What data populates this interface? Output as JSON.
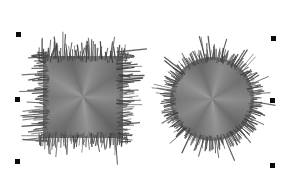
{
  "canvas": {
    "width": 289,
    "height": 174,
    "background": "#ffffff"
  },
  "objects": [
    {
      "name": "fringed-square",
      "shape": "rect",
      "x": 43,
      "y": 56,
      "width": 80,
      "height": 82,
      "fuzz": {
        "spacing": 1.25,
        "inset_min": 2,
        "inset_max": 7,
        "len_base": 3,
        "len_rand": 9,
        "long_chance": 0.18,
        "long_extra": 12,
        "tilt": 3.2,
        "seed": 11
      }
    },
    {
      "name": "fringed-circle",
      "shape": "circle",
      "cx": 212,
      "cy": 99,
      "r": 42,
      "fuzz": {
        "step_deg": 1.5,
        "inset_min": 2,
        "inset_max": 6,
        "len_base": 3,
        "len_rand": 8,
        "long_chance": 0.2,
        "long_extra": 11,
        "tilt_deg": 3,
        "seed": 29
      }
    }
  ],
  "fill_gradient": {
    "from_deg": -90,
    "stops": [
      {
        "color": "#7a7a7a",
        "angle": 0
      },
      {
        "color": "#929292",
        "angle": 32
      },
      {
        "color": "#6a6a6a",
        "angle": 72
      },
      {
        "color": "#8f8f8f",
        "angle": 106
      },
      {
        "color": "#707070",
        "angle": 146
      },
      {
        "color": "#8c8c8c",
        "angle": 182
      },
      {
        "color": "#676767",
        "angle": 226
      },
      {
        "color": "#959595",
        "angle": 262
      },
      {
        "color": "#6e6e6e",
        "angle": 300
      },
      {
        "color": "#898989",
        "angle": 332
      },
      {
        "color": "#7a7a7a",
        "angle": 360
      }
    ],
    "center_highlight": "rgba(255,255,255,0.10)",
    "edge_shade": "rgba(0,0,0,0.06)"
  },
  "fringe": {
    "colors": [
      "#3e3e3e",
      "#545454",
      "#686868",
      "#494949"
    ],
    "min_width": 0.7,
    "width_rand": 0.7,
    "min_opacity": 0.75
  },
  "selection": {
    "handle_size": 5,
    "handle_color": "#0a0a0a",
    "handles": [
      {
        "name": "top-left",
        "cx": 18,
        "cy": 34
      },
      {
        "name": "top-right",
        "cx": 273,
        "cy": 38
      },
      {
        "name": "middle-left",
        "cx": 17,
        "cy": 99
      },
      {
        "name": "middle-right",
        "cx": 272,
        "cy": 100
      },
      {
        "name": "bottom-left",
        "cx": 17,
        "cy": 161
      },
      {
        "name": "bottom-right",
        "cx": 272,
        "cy": 165
      }
    ]
  }
}
